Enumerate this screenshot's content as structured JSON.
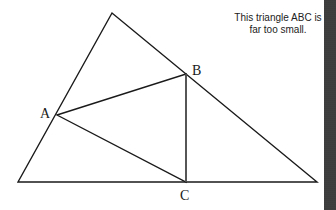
{
  "caption": {
    "line1": "This triangle ABC is",
    "line2": "far too small."
  },
  "diagram": {
    "outer_triangle": {
      "vertices": [
        [
          112,
          13
        ],
        [
          18,
          182
        ],
        [
          317,
          182
        ]
      ]
    },
    "inner_triangle": {
      "vertices": {
        "A": [
          57,
          115
        ],
        "B": [
          186,
          74
        ],
        "C": [
          186,
          182
        ]
      }
    },
    "labels": {
      "A": "A",
      "B": "B",
      "C": "C"
    },
    "stroke_color": "#1a1a1a"
  },
  "side_bar": {
    "color": "#3a3a3a"
  }
}
